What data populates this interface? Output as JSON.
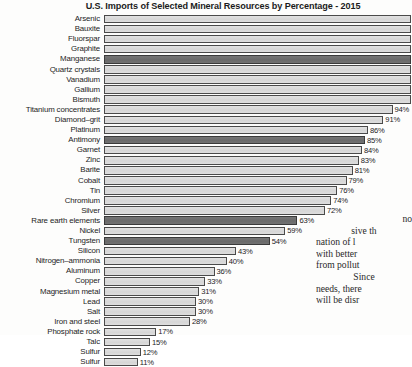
{
  "chart_data": {
    "type": "bar",
    "orientation": "horizontal",
    "title": "U.S. Imports of Selected Mineral Resources by Percentage - 2015",
    "xlabel": "",
    "ylabel": "",
    "xlim": [
      0,
      100
    ],
    "grid": false,
    "legend": "none",
    "value_suffix": "%",
    "categories": [
      "Arsenic",
      "Bauxite",
      "Fluorspar",
      "Graphite",
      "Manganese",
      "Quartz crystals",
      "Vanadium",
      "Gallium",
      "Bismuth",
      "Titanium concentrates",
      "Diamond–grit",
      "Platinum",
      "Antimony",
      "Garnet",
      "Zinc",
      "Barite",
      "Cobalt",
      "Tin",
      "Chromium",
      "Silver",
      "Rare earth elements",
      "Nickel",
      "Tungsten",
      "Silicon",
      "Nitrogen–ammonia",
      "Aluminum",
      "Copper",
      "Magnesium metal",
      "Lead",
      "Salt",
      "Iron and steel",
      "Phosphate rock",
      "Talc",
      "Sulfur"
    ],
    "values": [
      100,
      100,
      100,
      100,
      100,
      100,
      100,
      100,
      100,
      94,
      91,
      86,
      85,
      84,
      83,
      81,
      79,
      76,
      74,
      72,
      63,
      59,
      54,
      43,
      40,
      36,
      33,
      31,
      30,
      30,
      28,
      17,
      15,
      12
    ],
    "value_labels": [
      "",
      "",
      "",
      "",
      "",
      "",
      "",
      "",
      "",
      "94%",
      "91%",
      "86%",
      "85%",
      "84%",
      "83%",
      "81%",
      "79%",
      "76%",
      "74%",
      "72%",
      "63%",
      "59%",
      "54%",
      "43%",
      "40%",
      "36%",
      "33%",
      "31%",
      "30%",
      "30%",
      "28%",
      "17%",
      "15%",
      "12%"
    ],
    "highlighted": [
      false,
      false,
      false,
      false,
      true,
      false,
      false,
      false,
      false,
      false,
      false,
      false,
      true,
      false,
      false,
      false,
      false,
      false,
      false,
      false,
      true,
      false,
      true,
      false,
      false,
      false,
      false,
      false,
      false,
      false,
      false,
      false,
      false,
      false
    ],
    "colors": {
      "bar_light": "#dcdcdc",
      "bar_dark": "#6e6e6e",
      "bar_outline": "#4a4a4a",
      "text": "#242424",
      "background": "#fdfdfc"
    }
  },
  "sulfur_row": {
    "label": "Sulfur",
    "value_label": "11%",
    "value": 11
  },
  "body_text": {
    "lines": [
      "no",
      "sive th",
      "nation of l",
      "with better",
      "from pollut",
      "Since",
      "needs, there",
      "will be disr"
    ]
  }
}
